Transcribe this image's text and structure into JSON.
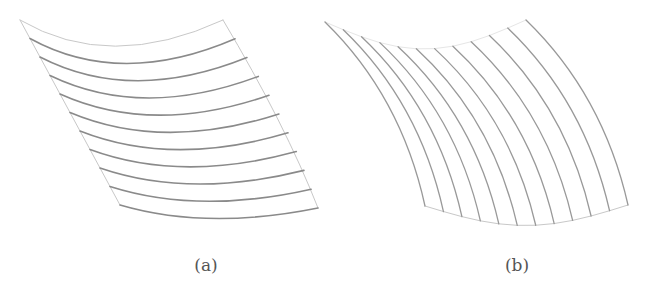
{
  "figure": {
    "panels": [
      {
        "id": "a",
        "caption": "(a)",
        "caption_pos": [
          206,
          265
        ],
        "description": "Curved quadrilateral mesh patch with horizontal grid arcs",
        "corners": {
          "top_left": [
            20,
            20
          ],
          "top_right": [
            223,
            20
          ],
          "bottom_left": [
            120,
            205
          ],
          "bottom_right": [
            318,
            208
          ]
        },
        "line_direction": "horizontal",
        "line_count": 11
      },
      {
        "id": "b",
        "caption": "(b)",
        "caption_pos": [
          517,
          265
        ],
        "description": "Curved quadrilateral mesh patch with vertical grid arcs",
        "corners": {
          "top_left": [
            325,
            22
          ],
          "top_right": [
            526,
            20
          ],
          "bottom_left": [
            425,
            206
          ],
          "bottom_right": [
            628,
            205
          ]
        },
        "line_direction": "vertical",
        "line_count": 12
      }
    ],
    "colors": {
      "line_dark": "#8a8a8a",
      "line_light": "#c8c8c8",
      "background": "#ffffff"
    }
  }
}
